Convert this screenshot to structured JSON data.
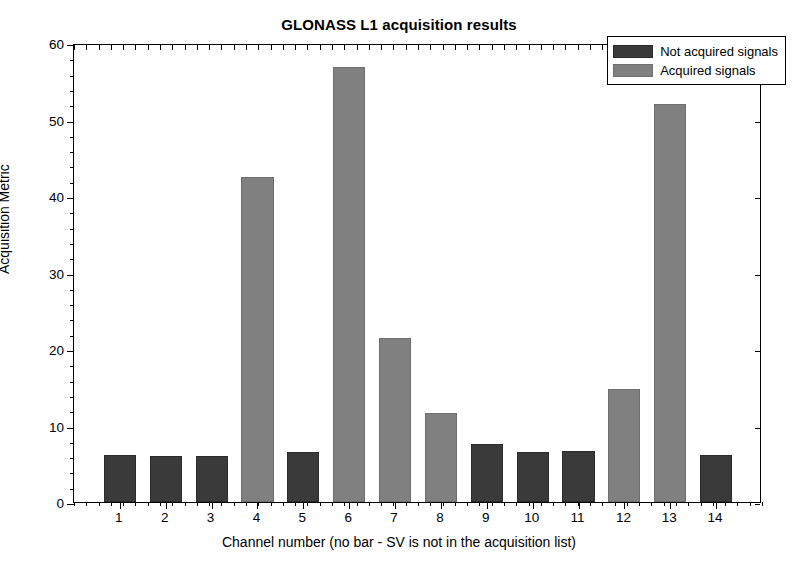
{
  "chart_data": {
    "type": "bar",
    "title": "GLONASS L1 acquisition results",
    "xlabel": "Channel number (no bar - SV is not in the acquisition list)",
    "ylabel": "Acquisition Metric",
    "categories": [
      "1",
      "2",
      "3",
      "4",
      "5",
      "6",
      "7",
      "8",
      "9",
      "10",
      "11",
      "12",
      "13",
      "14"
    ],
    "values": [
      6.2,
      6.0,
      6.0,
      42.5,
      6.5,
      56.8,
      21.5,
      11.6,
      7.6,
      6.6,
      6.7,
      14.8,
      52.0,
      6.2
    ],
    "bar_classes": [
      "notacq",
      "notacq",
      "notacq",
      "acq",
      "notacq",
      "acq",
      "acq",
      "acq",
      "notacq",
      "notacq",
      "notacq",
      "acq",
      "acq",
      "notacq"
    ],
    "ylim": [
      0,
      60
    ],
    "yticks": [
      0,
      10,
      20,
      30,
      40,
      50,
      60
    ],
    "ytick_labels": [
      "0",
      "10",
      "20",
      "30",
      "40",
      "50",
      "60"
    ],
    "grid": false,
    "legend_position": "top-right",
    "legend": [
      {
        "label": "Not acquired signals",
        "color": "#3a3a3a",
        "key": "notacq"
      },
      {
        "label": "Acquired signals",
        "color": "#808080",
        "key": "acq"
      }
    ]
  }
}
